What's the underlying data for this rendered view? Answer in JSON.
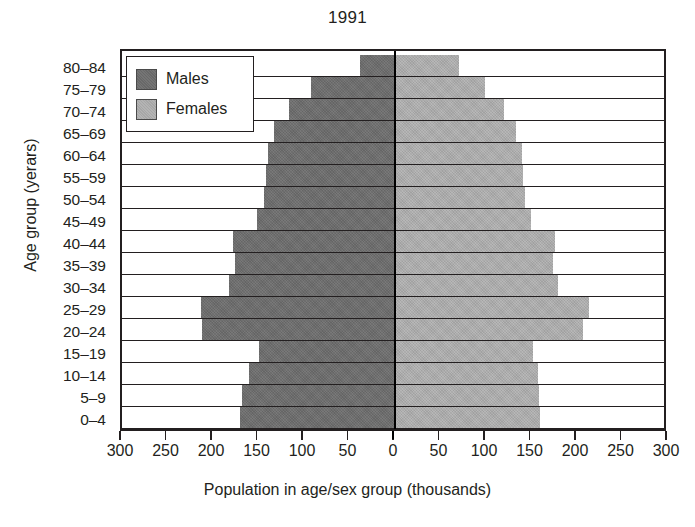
{
  "chart_data": {
    "type": "bar",
    "subtype": "population-pyramid",
    "title": "1991",
    "xlabel": "Population in age/sex group (thousands)",
    "ylabel": "Age group (yerars)",
    "categories": [
      "0–4",
      "5–9",
      "10–14",
      "15–19",
      "20–24",
      "25–29",
      "30–34",
      "35–39",
      "40–44",
      "45–49",
      "50–54",
      "55–59",
      "60–64",
      "65–69",
      "70–74",
      "75–79",
      "80–84"
    ],
    "series": [
      {
        "name": "Males",
        "color": "#6e6e6e",
        "side": "left",
        "values": [
          170,
          168,
          160,
          150,
          212,
          213,
          182,
          176,
          178,
          152,
          144,
          142,
          140,
          133,
          117,
          92,
          38
        ]
      },
      {
        "name": "Females",
        "color": "#aeaeae",
        "side": "right",
        "values": [
          158,
          157,
          156,
          150,
          205,
          212,
          178,
          172,
          175,
          148,
          142,
          140,
          138,
          132,
          119,
          98,
          69
        ]
      }
    ],
    "xticks": [
      300,
      250,
      200,
      150,
      100,
      50,
      0,
      50,
      100,
      150,
      200,
      250,
      300
    ],
    "xlim": [
      -300,
      300
    ],
    "grid": false,
    "legend_position": "top-left",
    "legend_entries": [
      "Males",
      "Females"
    ]
  },
  "legend": {
    "males_label": "Males",
    "females_label": "Females"
  }
}
